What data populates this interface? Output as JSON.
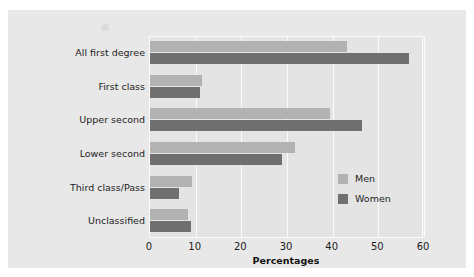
{
  "chart_data": {
    "type": "bar",
    "orientation": "horizontal",
    "title": "",
    "xlabel": "Percentages",
    "ylabel": "",
    "xlim": [
      0,
      60
    ],
    "xticks": [
      0,
      10,
      20,
      30,
      40,
      50,
      60
    ],
    "grid": true,
    "legend_position": "inside-bottom-right",
    "categories": [
      "All first degree",
      "First class",
      "Upper second",
      "Lower second",
      "Third class/Pass",
      "Unclassified"
    ],
    "series": [
      {
        "name": "Men",
        "color": "#b2b2b2",
        "values": [
          43.1,
          11.4,
          39.4,
          31.7,
          9.2,
          8.4
        ]
      },
      {
        "name": "Women",
        "color": "#6f6f6f",
        "values": [
          56.7,
          10.9,
          46.4,
          29.0,
          6.3,
          8.9
        ]
      }
    ]
  },
  "legend": {
    "items": [
      {
        "label": "Men",
        "color": "#b2b2b2"
      },
      {
        "label": "Women",
        "color": "#6f6f6f"
      }
    ]
  },
  "axis": {
    "x_title": "Percentages",
    "x_tick_labels": [
      "0",
      "10",
      "20",
      "30",
      "40",
      "50",
      "60"
    ]
  },
  "colors": {
    "figure_background": "#ffffff",
    "panel_background": "#e8e8e8",
    "plot_background": "#e4e4e4",
    "gridline": "#fbfbfb",
    "men_bar": "#b2b2b2",
    "women_bar": "#6f6f6f",
    "text": "#1c1c1c"
  }
}
